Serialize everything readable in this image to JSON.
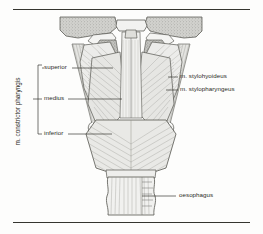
{
  "figure": {
    "background_color": "#fdfdfc",
    "ink_color": "#2b2b26",
    "bone_fill": "#cfcfcb",
    "muscle_fill": "#e8e8e6",
    "rules": {
      "top_label": "top-divider-rule",
      "bottom_label": "bottom-divider-rule"
    }
  },
  "labels": {
    "bracket_group": "m. constrictor pharyngis",
    "superior": "superior",
    "medius": "medius",
    "inferior": "inferior",
    "stylohyoideus": "m. stylohyoideus",
    "stylopharyngeus": "m. stylopharyngeus",
    "oesophagus": "oesophagus"
  },
  "icons": {
    "bracket": "bracket-icon",
    "leader": "leader-line-icon"
  }
}
